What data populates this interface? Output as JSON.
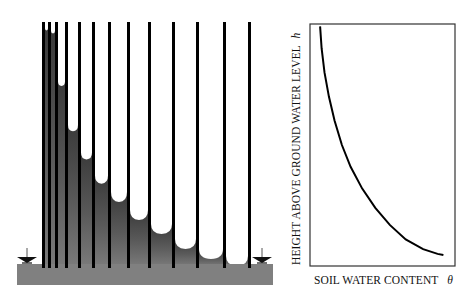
{
  "figure": {
    "left_panel": {
      "description": "Capillary tubes of decreasing radius standing in a water reservoir; water rises higher in narrower tubes",
      "reservoir": {
        "x": 17,
        "y": 264,
        "width": 256,
        "height": 21
      },
      "tube_top_y": 22,
      "tube_bottom_y": 268,
      "tube_wall_width": 3,
      "tube_walls_x": [
        42,
        48,
        55,
        65,
        78,
        92,
        108,
        127,
        148,
        172,
        196,
        223,
        248
      ],
      "water_levels_y": [
        30,
        33,
        85,
        130,
        158,
        182,
        200,
        218,
        232,
        247,
        257,
        264
      ],
      "water_table_markers": [
        {
          "name": "left-water-table-arrow",
          "x": 27,
          "y": 264
        },
        {
          "name": "right-water-table-arrow",
          "x": 262,
          "y": 264
        }
      ],
      "colors": {
        "water_top": "#3a3a3a",
        "water_bottom": "#7a7a7a",
        "reservoir": "#808080",
        "tube_wall": "#000000"
      }
    },
    "right_panel": {
      "frame": {
        "x": 310,
        "y": 24,
        "width": 145,
        "height": 242
      },
      "x_label": "SOIL  WATER CONTENT",
      "x_symbol": "θ",
      "y_label": "HEIGHT ABOVE GROUND WATER LEVEL",
      "y_symbol": "h"
    }
  },
  "chart_data": {
    "type": "line",
    "title": "",
    "xlabel": "SOIL WATER CONTENT θ",
    "ylabel": "HEIGHT ABOVE GROUND WATER LEVEL h",
    "grid": false,
    "ticks": "none",
    "series": [
      {
        "name": "retention curve",
        "x": [
          0.07,
          0.08,
          0.1,
          0.13,
          0.17,
          0.22,
          0.28,
          0.36,
          0.45,
          0.55,
          0.66,
          0.78,
          0.88,
          0.92
        ],
        "y": [
          0.99,
          0.9,
          0.8,
          0.7,
          0.6,
          0.5,
          0.41,
          0.32,
          0.24,
          0.17,
          0.11,
          0.07,
          0.05,
          0.045
        ]
      }
    ],
    "xlim": [
      0,
      1
    ],
    "ylim": [
      0,
      1
    ]
  }
}
